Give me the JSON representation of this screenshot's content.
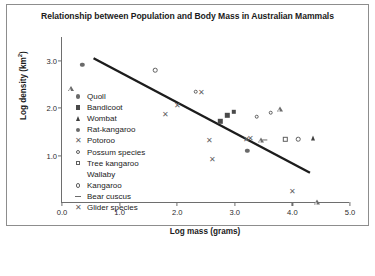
{
  "chart_data": {
    "type": "scatter",
    "title": "Relationship between Population and Body Mass in Australian Mammals",
    "xlabel": "Log mass (grams)",
    "ylabel": "Log density (km²)",
    "xlim": [
      0.0,
      5.0
    ],
    "ylim": [
      0.0,
      3.5
    ],
    "xticks": [
      "0.0",
      "1.0",
      "2.0",
      "3.0",
      "4.0",
      "5.0"
    ],
    "xtick_values": [
      0.0,
      1.0,
      2.0,
      3.0,
      4.0,
      5.0
    ],
    "yticks": [
      "1.0",
      "2.0",
      "3.0"
    ],
    "ytick_values": [
      1.0,
      2.0,
      3.0
    ],
    "grid": false,
    "legend_position": "inside-left",
    "trendline": {
      "label": "regression line",
      "x_start": 0.55,
      "y_start": 3.05,
      "x_end": 4.32,
      "y_end": 0.62,
      "color": "#1c1c1c"
    },
    "series": [
      {
        "name": "Quoll",
        "marker": "filled-circle",
        "points": [
          [
            0.35,
            2.92
          ],
          [
            3.22,
            1.1
          ]
        ]
      },
      {
        "name": "Bandicoot",
        "marker": "filled-square",
        "points": [
          [
            2.75,
            1.72
          ],
          [
            2.87,
            1.85
          ],
          [
            2.98,
            1.92
          ]
        ]
      },
      {
        "name": "Wombat",
        "marker": "filled-triangle",
        "points": [
          [
            4.35,
            1.38
          ]
        ]
      },
      {
        "name": "Rat-kangaroo",
        "marker": "filled-circle-small",
        "points": [
          [
            0.35,
            2.92
          ]
        ]
      },
      {
        "name": "Potoroo",
        "marker": "x-cross",
        "points": [
          [
            2.0,
            2.06
          ],
          [
            2.3,
            1.9
          ],
          [
            2.56,
            1.32
          ],
          [
            2.62,
            0.92
          ],
          [
            3.2,
            1.35
          ],
          [
            3.25,
            1.36
          ],
          [
            2.42,
            2.33
          ],
          [
            4.0,
            0.26
          ]
        ]
      },
      {
        "name": "Possum species",
        "marker": "open-circle",
        "points": [
          [
            1.62,
            2.8
          ],
          [
            2.32,
            2.35
          ],
          [
            3.38,
            1.82
          ],
          [
            3.62,
            1.9
          ],
          [
            4.1,
            1.35
          ]
        ]
      },
      {
        "name": "Tree kangaroo",
        "marker": "open-square",
        "points": [
          [
            3.88,
            1.34
          ]
        ]
      },
      {
        "name": "Wallaby",
        "marker": "open-triangle",
        "points": [
          [
            3.78,
            1.88
          ],
          [
            3.45,
            1.33
          ],
          [
            4.42,
            0.12
          ]
        ]
      },
      {
        "name": "Kangaroo",
        "marker": "open-circle",
        "points": [
          [
            4.1,
            1.35
          ]
        ]
      },
      {
        "name": "Bear cuscus",
        "marker": "dash",
        "points": [
          [
            3.52,
            1.33
          ]
        ]
      },
      {
        "name": "Glider species",
        "marker": "x-cross-light",
        "points": [
          [
            2.42,
            2.33
          ]
        ]
      }
    ],
    "all_points": [
      {
        "x": 0.35,
        "y": 2.92,
        "marker": "filled-circle"
      },
      {
        "x": 1.62,
        "y": 2.8,
        "marker": "open-circle"
      },
      {
        "x": 2.32,
        "y": 2.35,
        "marker": "open-circle"
      },
      {
        "x": 2.42,
        "y": 2.33,
        "marker": "x-cross"
      },
      {
        "x": 2.0,
        "y": 2.06,
        "marker": "x-cross"
      },
      {
        "x": 1.8,
        "y": 1.88,
        "marker": "x-cross"
      },
      {
        "x": 2.98,
        "y": 1.92,
        "marker": "filled-square"
      },
      {
        "x": 2.87,
        "y": 1.85,
        "marker": "filled-square"
      },
      {
        "x": 2.75,
        "y": 1.72,
        "marker": "filled-square"
      },
      {
        "x": 3.38,
        "y": 1.82,
        "marker": "open-circle"
      },
      {
        "x": 3.62,
        "y": 1.9,
        "marker": "open-circle"
      },
      {
        "x": 3.78,
        "y": 1.88,
        "marker": "open-triangle"
      },
      {
        "x": 2.56,
        "y": 1.32,
        "marker": "x-cross"
      },
      {
        "x": 3.2,
        "y": 1.35,
        "marker": "x-cross"
      },
      {
        "x": 3.27,
        "y": 1.36,
        "marker": "x-cross"
      },
      {
        "x": 3.45,
        "y": 1.33,
        "marker": "open-triangle"
      },
      {
        "x": 3.52,
        "y": 1.33,
        "marker": "dash"
      },
      {
        "x": 3.88,
        "y": 1.34,
        "marker": "open-square"
      },
      {
        "x": 4.1,
        "y": 1.35,
        "marker": "open-circle"
      },
      {
        "x": 4.35,
        "y": 1.38,
        "marker": "filled-triangle"
      },
      {
        "x": 3.22,
        "y": 1.1,
        "marker": "filled-circle"
      },
      {
        "x": 2.62,
        "y": 0.92,
        "marker": "x-cross"
      },
      {
        "x": 4.0,
        "y": 0.26,
        "marker": "x-cross"
      },
      {
        "x": 4.42,
        "y": 0.12,
        "marker": "open-triangle"
      }
    ],
    "legend": [
      {
        "label": "Quoll",
        "marker": "filled-circle"
      },
      {
        "label": "Bandicoot",
        "marker": "filled-square"
      },
      {
        "label": "Wombat",
        "marker": "filled-triangle"
      },
      {
        "label": "Rat-kangaroo",
        "marker": "filled-circle"
      },
      {
        "label": "Potoroo",
        "marker": "x-cross"
      },
      {
        "label": "Possum species",
        "marker": "open-circle"
      },
      {
        "label": "Tree kangaroo",
        "marker": "open-square"
      },
      {
        "label": "Wallaby",
        "marker": "open-triangle"
      },
      {
        "label": "Kangaroo",
        "marker": "open-circle"
      },
      {
        "label": "Bear cuscus",
        "marker": "dash"
      },
      {
        "label": "Glider species",
        "marker": "x-cross"
      }
    ]
  }
}
